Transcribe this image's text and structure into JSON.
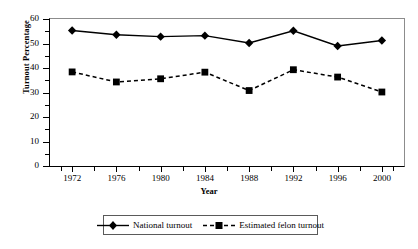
{
  "chart_data": {
    "type": "line",
    "title": "",
    "xlabel": "Year",
    "ylabel": "Turnout Percentage",
    "categories": [
      "1972",
      "1976",
      "1980",
      "1984",
      "1988",
      "1992",
      "1996",
      "2000"
    ],
    "x": [
      1972,
      1976,
      1980,
      1984,
      1988,
      1992,
      1996,
      2000
    ],
    "xlim": [
      1970,
      2002
    ],
    "ylim": [
      0,
      60
    ],
    "yticks": [
      0,
      10,
      20,
      30,
      40,
      50,
      60
    ],
    "ytick_labels": [
      "0",
      "10",
      "20",
      "30",
      "40",
      "50",
      "60"
    ],
    "grid": false,
    "legend_position": "below",
    "series": [
      {
        "name": "National turnout",
        "marker": "diamond",
        "line_style": "solid",
        "color": "#000000",
        "values": [
          55.3,
          53.6,
          52.8,
          53.2,
          50.2,
          55.2,
          49.0,
          51.2
        ]
      },
      {
        "name": "Estimated felon turnout",
        "marker": "square",
        "line_style": "dashed",
        "color": "#000000",
        "values": [
          38.4,
          34.3,
          35.6,
          38.3,
          30.8,
          39.3,
          36.3,
          30.2
        ]
      }
    ]
  },
  "legend": {
    "items": [
      {
        "label": "National turnout"
      },
      {
        "label": "Estimated felon turnout"
      }
    ]
  }
}
